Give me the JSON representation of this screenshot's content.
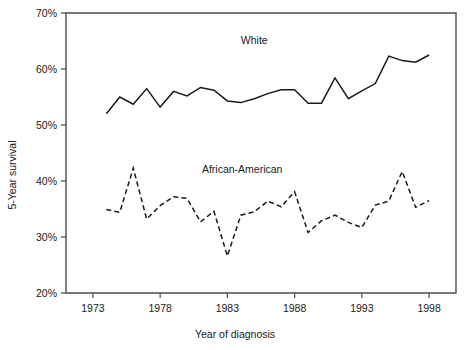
{
  "chart_data": {
    "type": "line",
    "title": "",
    "xlabel": "Year of diagnosis",
    "ylabel": "5-Year survival",
    "xlim": [
      1971,
      2000
    ],
    "ylim": [
      20,
      70
    ],
    "grid": false,
    "legend_position": "inline-annotation",
    "x_tick_labels": [
      "1973",
      "1978",
      "1983",
      "1988",
      "1993",
      "1998"
    ],
    "x_tick_values": [
      1973,
      1978,
      1983,
      1988,
      1993,
      1998
    ],
    "y_tick_labels": [
      "20%",
      "30%",
      "40%",
      "50%",
      "60%",
      "70%"
    ],
    "y_tick_values": [
      20,
      30,
      40,
      50,
      60,
      70
    ],
    "x": [
      1974,
      1975,
      1976,
      1977,
      1978,
      1979,
      1980,
      1981,
      1982,
      1983,
      1984,
      1985,
      1986,
      1987,
      1988,
      1989,
      1990,
      1991,
      1992,
      1993,
      1994,
      1995,
      1996,
      1997,
      1998
    ],
    "series": [
      {
        "name": "White",
        "line_style": "solid",
        "color": "#1a1a1a",
        "label_x": 1985,
        "label_y": 64.5,
        "values": [
          52.0,
          55.0,
          53.7,
          56.5,
          53.2,
          56.0,
          55.2,
          56.7,
          56.2,
          54.3,
          54.0,
          54.7,
          55.6,
          56.3,
          56.3,
          53.9,
          53.9,
          58.4,
          54.7,
          56.1,
          57.4,
          62.3,
          61.5,
          61.2,
          62.5
        ]
      },
      {
        "name": "African-American",
        "line_style": "dashed",
        "color": "#1a1a1a",
        "label_x": 1984.1,
        "label_y": 41.4,
        "values": [
          34.9,
          34.4,
          42.3,
          33.2,
          35.6,
          37.2,
          36.9,
          32.7,
          34.6,
          26.6,
          33.9,
          34.5,
          36.4,
          35.4,
          38.1,
          30.8,
          32.9,
          33.9,
          32.6,
          31.7,
          35.7,
          36.4,
          41.7,
          35.3,
          36.5
        ]
      }
    ]
  }
}
